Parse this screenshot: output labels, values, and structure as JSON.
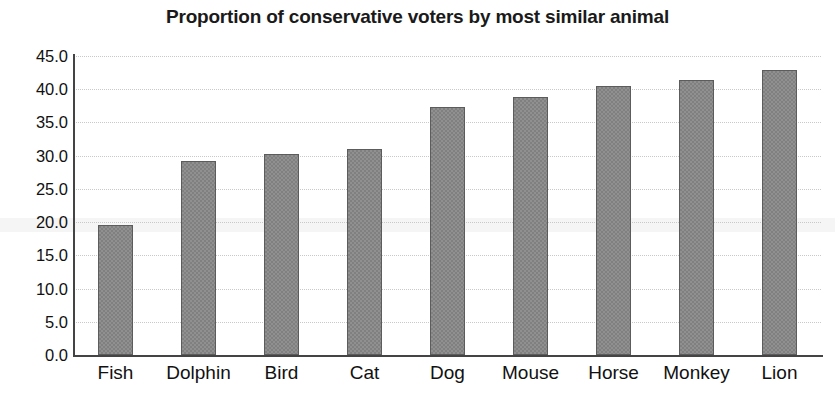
{
  "chart_data": {
    "type": "bar",
    "title": "Proportion of conservative voters by most similar animal",
    "xlabel": "",
    "ylabel": "",
    "categories": [
      "Fish",
      "Dolphin",
      "Bird",
      "Cat",
      "Dog",
      "Mouse",
      "Horse",
      "Monkey",
      "Lion"
    ],
    "values": [
      19.5,
      29.2,
      30.2,
      31.0,
      37.4,
      38.9,
      40.5,
      41.4,
      42.9
    ],
    "ylim": [
      0.0,
      45.0
    ],
    "ytick_values": [
      0.0,
      5.0,
      10.0,
      15.0,
      20.0,
      25.0,
      30.0,
      35.0,
      40.0,
      45.0
    ],
    "ytick_labels": [
      "0.0",
      "5.0",
      "10.0",
      "15.0",
      "20.0",
      "25.0",
      "30.0",
      "35.0",
      "40.0",
      "45.0"
    ],
    "grid": true,
    "grid_axis": "y",
    "grid_style": "dotted",
    "legend": false,
    "legend_position": "none",
    "bar_color": "#808080",
    "bar_edge_color": "#5c5c5c",
    "axis_color": "#444444",
    "grid_color": "#c9c9c9",
    "title_color": "#1a1a1a",
    "tick_label_color": "#111111"
  }
}
